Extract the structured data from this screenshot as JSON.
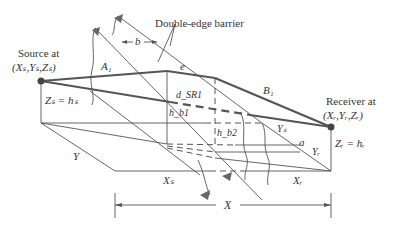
{
  "diagram": {
    "title": "Double-edge barrier",
    "source": {
      "label_line1": "Source at",
      "label_line2": "(Xₛ,Yₛ,Zₛ)",
      "height_label": "Zₛ = hₛ"
    },
    "receiver": {
      "label_line1": "Receiver at",
      "label_line2": "(Xᵣ,Yᵣ,Zᵣ)",
      "height_label": "Zᵣ = hᵣ"
    },
    "labels": {
      "barrier": "Double-edge barrier",
      "b": "b",
      "e": "e",
      "A1": "A₁",
      "B1": "B₁",
      "dSR1": "d_SR1",
      "hb1": "h_b1",
      "hb2": "h_b2",
      "Y": "Y",
      "YS": "Yₛ",
      "YR": "Yᵣ",
      "a": "a",
      "XS": "Xₛ",
      "XR": "Xᵣ",
      "X": "X"
    },
    "colors": {
      "line": "#555555",
      "text": "#333333",
      "background": "#ffffff"
    }
  }
}
